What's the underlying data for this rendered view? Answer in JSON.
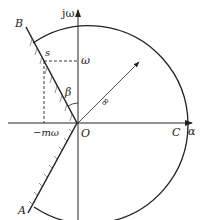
{
  "diagram": {
    "axes": {
      "vertical_label": "jω",
      "horizontal_label": "α",
      "origin_label": "O"
    },
    "points": {
      "B": "B",
      "A": "A",
      "C": "C",
      "s": "s",
      "omega": "ω",
      "neg_m_omega": "−mω"
    },
    "angle_label": "β",
    "radius_marker": "∞",
    "colors": {
      "stroke": "#222222",
      "background": "#ffffff"
    }
  }
}
